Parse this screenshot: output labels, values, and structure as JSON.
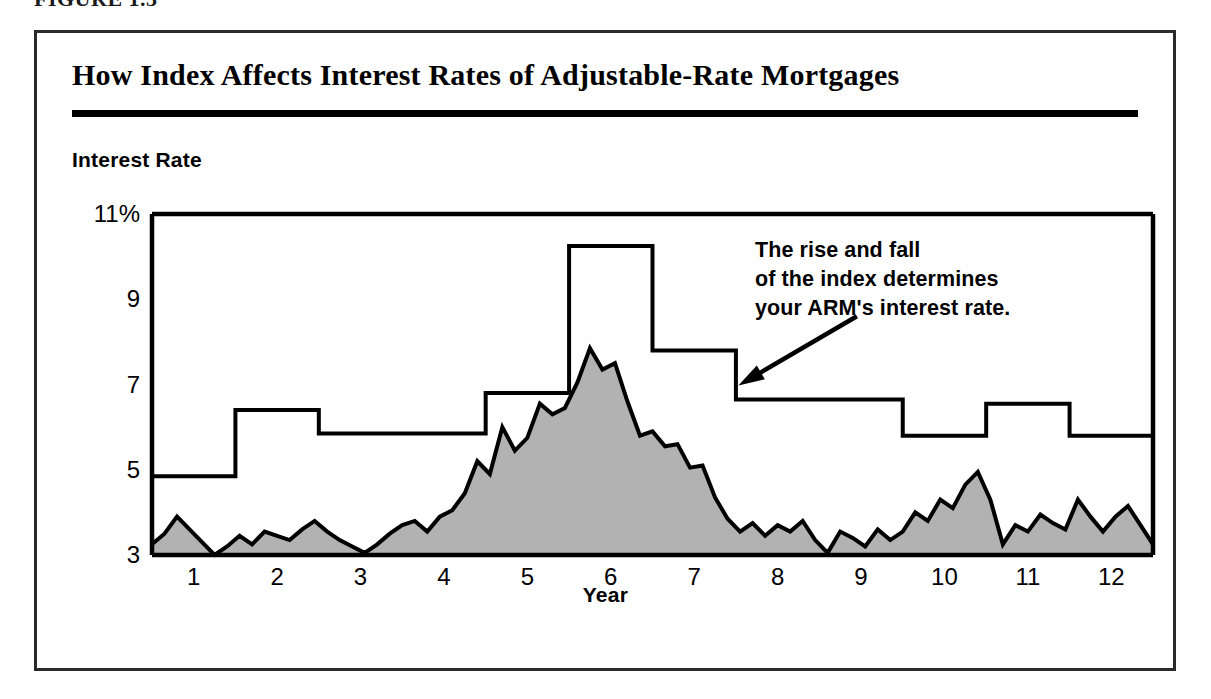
{
  "figure": {
    "caption": "FIGURE 1.3",
    "outer_border_color": "#2a2a2a"
  },
  "chart_title": "How Index Affects Interest Rates of Adjustable-Rate Mortgages",
  "annotation": {
    "line1": "The rise and fall",
    "line2": "of the index determines",
    "line3": "your ARM's interest rate."
  },
  "chart_data": {
    "type": "area",
    "title": "How Index Affects Interest Rates of Adjustable-Rate Mortgages",
    "xlabel": "Year",
    "ylabel": "Interest Rate",
    "ylim": [
      3,
      11
    ],
    "xlim": [
      0.5,
      12.5
    ],
    "grid": false,
    "legend": null,
    "ytick_labels": [
      "11%",
      "9",
      "7",
      "5",
      "3"
    ],
    "ytick_values": [
      11,
      9,
      7,
      5,
      3
    ],
    "xtick_labels": [
      "1",
      "2",
      "3",
      "4",
      "5",
      "6",
      "7",
      "8",
      "9",
      "10",
      "11",
      "12"
    ],
    "xtick_values": [
      1,
      2,
      3,
      4,
      5,
      6,
      7,
      8,
      9,
      10,
      11,
      12
    ],
    "colors": {
      "area_fill": "#b2b2b2",
      "area_line": "#000000",
      "step_line": "#000000",
      "axis": "#000000"
    },
    "series": [
      {
        "name": "Index",
        "kind": "area",
        "fill": "#b2b2b2",
        "x": [
          0.5,
          0.65,
          0.8,
          0.95,
          1.1,
          1.25,
          1.4,
          1.55,
          1.7,
          1.85,
          2.0,
          2.15,
          2.3,
          2.45,
          2.6,
          2.75,
          2.9,
          3.05,
          3.2,
          3.35,
          3.5,
          3.65,
          3.8,
          3.95,
          4.1,
          4.25,
          4.4,
          4.55,
          4.7,
          4.85,
          5.0,
          5.15,
          5.3,
          5.45,
          5.6,
          5.75,
          5.9,
          6.05,
          6.2,
          6.35,
          6.5,
          6.65,
          6.8,
          6.95,
          7.1,
          7.25,
          7.4,
          7.55,
          7.7,
          7.85,
          8.0,
          8.15,
          8.3,
          8.45,
          8.6,
          8.75,
          8.9,
          9.05,
          9.2,
          9.35,
          9.5,
          9.65,
          9.8,
          9.95,
          10.1,
          10.25,
          10.4,
          10.55,
          10.7,
          10.85,
          11.0,
          11.15,
          11.3,
          11.45,
          11.6,
          11.75,
          11.9,
          12.05,
          12.2,
          12.35,
          12.5
        ],
        "values": [
          3.25,
          3.5,
          3.9,
          3.6,
          3.3,
          3.0,
          3.2,
          3.45,
          3.25,
          3.55,
          3.45,
          3.35,
          3.6,
          3.8,
          3.55,
          3.35,
          3.2,
          3.05,
          3.25,
          3.5,
          3.7,
          3.8,
          3.55,
          3.9,
          4.05,
          4.45,
          5.2,
          4.9,
          6.0,
          5.45,
          5.75,
          6.55,
          6.3,
          6.45,
          7.05,
          7.85,
          7.35,
          7.5,
          6.6,
          5.8,
          5.9,
          5.55,
          5.6,
          5.05,
          5.1,
          4.35,
          3.85,
          3.55,
          3.75,
          3.45,
          3.7,
          3.55,
          3.8,
          3.35,
          3.05,
          3.55,
          3.4,
          3.2,
          3.6,
          3.35,
          3.55,
          4.0,
          3.8,
          4.3,
          4.1,
          4.65,
          4.95,
          4.3,
          3.25,
          3.7,
          3.55,
          3.95,
          3.75,
          3.6,
          4.3,
          3.9,
          3.55,
          3.9,
          4.15,
          3.7,
          3.25
        ]
      },
      {
        "name": "ARM Interest Rate",
        "kind": "step",
        "x_breaks": [
          0.5,
          1.5,
          2.5,
          4.5,
          5.5,
          6.5,
          7.5,
          9.5,
          10.5,
          11.5,
          12.5
        ],
        "values": [
          4.85,
          6.4,
          5.85,
          6.8,
          10.25,
          7.8,
          6.65,
          5.8,
          6.55,
          5.8,
          7.65
        ]
      }
    ],
    "annotations": [
      {
        "text": "The rise and fall of the index determines your ARM's interest rate.",
        "arrow_from": [
          8.95,
          8.6
        ],
        "arrow_to": [
          7.55,
          7.0
        ]
      }
    ]
  }
}
